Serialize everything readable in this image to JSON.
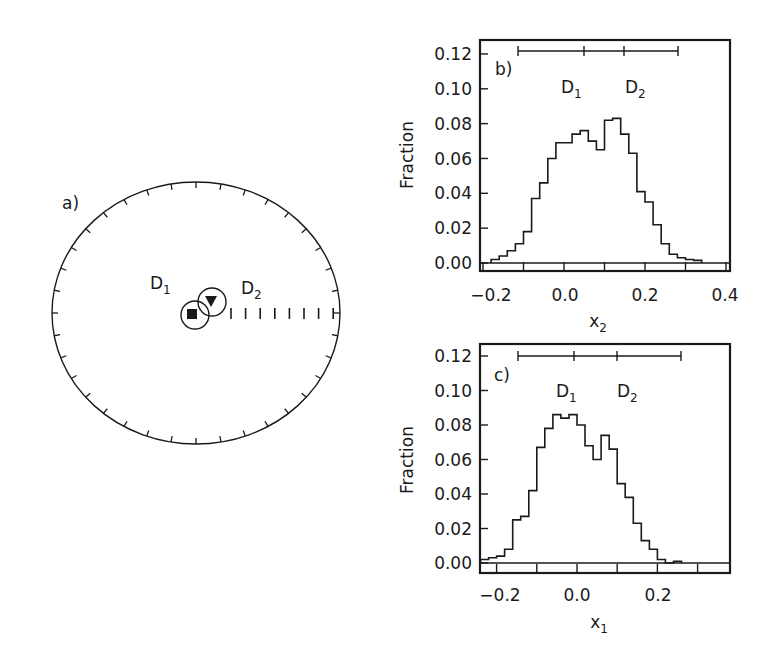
{
  "chart_data": [
    {
      "panel": "a",
      "type": "scatter",
      "title": "",
      "panel_label": "a)",
      "description": "Polar/circular plot with 36 perimeter ticks (every 10 degrees) and a horizontal radial scale of tick marks; two markers with confidence circles near the center",
      "markers": [
        {
          "name": "D1",
          "label": "D",
          "subscript": "1",
          "symbol": "filled-square",
          "x": 192,
          "y": 314
        },
        {
          "name": "D2",
          "label": "D",
          "subscript": "2",
          "symbol": "filled-down-triangle",
          "x": 211,
          "y": 300
        }
      ],
      "perimeter_ticks": 36,
      "radial_scale_ticks": 8
    },
    {
      "panel": "b",
      "type": "bar",
      "style": "step-histogram",
      "panel_label": "b)",
      "title": "",
      "xlabel": "x",
      "xlabel_sub": "2",
      "ylabel": "Fraction",
      "xlim": [
        -0.2,
        0.4
      ],
      "ylim": [
        0.0,
        0.12
      ],
      "xticks": [
        "-0.2",
        "0.0",
        "0.2",
        "0.4"
      ],
      "yticks": [
        "0.00",
        "0.02",
        "0.04",
        "0.06",
        "0.08",
        "0.10",
        "0.12"
      ],
      "bin_width": 0.02,
      "bin_start": -0.18,
      "values": [
        0.002,
        0.004,
        0.007,
        0.011,
        0.018,
        0.037,
        0.046,
        0.06,
        0.069,
        0.069,
        0.074,
        0.076,
        0.07,
        0.065,
        0.082,
        0.083,
        0.074,
        0.063,
        0.041,
        0.035,
        0.022,
        0.011,
        0.005,
        0.003,
        0.002,
        0.0015
      ],
      "error_bar": {
        "min": -0.13,
        "D1": 0.035,
        "D2": 0.135,
        "max": 0.28
      },
      "annotations": [
        {
          "text": "D",
          "sub": "1"
        },
        {
          "text": "D",
          "sub": "2"
        }
      ]
    },
    {
      "panel": "c",
      "type": "bar",
      "style": "step-histogram",
      "panel_label": "c)",
      "title": "",
      "xlabel": "x",
      "xlabel_sub": "1",
      "ylabel": "Fraction",
      "xlim": [
        -0.25,
        0.35
      ],
      "ylim": [
        0.0,
        0.12
      ],
      "xticks": [
        "-0.2",
        "0.0",
        "0.2"
      ],
      "yticks": [
        "0.00",
        "0.02",
        "0.04",
        "0.06",
        "0.08",
        "0.10",
        "0.12"
      ],
      "bin_width": 0.02,
      "bin_start": -0.24,
      "values": [
        0.002,
        0.003,
        0.004,
        0.008,
        0.025,
        0.027,
        0.042,
        0.067,
        0.078,
        0.086,
        0.084,
        0.086,
        0.08,
        0.068,
        0.06,
        0.074,
        0.066,
        0.046,
        0.038,
        0.023,
        0.013,
        0.008,
        0.002,
        0.0,
        0.001
      ],
      "error_bar": {
        "min": -0.155,
        "D1": -0.015,
        "D2": 0.09,
        "max": 0.25
      },
      "annotations": [
        {
          "text": "D",
          "sub": "1"
        },
        {
          "text": "D",
          "sub": "2"
        }
      ]
    }
  ],
  "panel_a": {
    "label": "a)",
    "d1_label": "D",
    "d1_sub": "1",
    "d2_label": "D",
    "d2_sub": "2"
  },
  "panel_b": {
    "label": "b)",
    "ylabel": "Fraction",
    "xlabel": "x",
    "xlabel_sub": "2",
    "d1_label": "D",
    "d1_sub": "1",
    "d2_label": "D",
    "d2_sub": "2",
    "xtick_labels": [
      "−0.2",
      "0.0",
      "0.2",
      "0.4"
    ],
    "ytick_labels": [
      "0.00",
      "0.02",
      "0.04",
      "0.06",
      "0.08",
      "0.10",
      "0.12"
    ]
  },
  "panel_c": {
    "label": "c)",
    "ylabel": "Fraction",
    "xlabel": "x",
    "xlabel_sub": "1",
    "d1_label": "D",
    "d1_sub": "1",
    "d2_label": "D",
    "d2_sub": "2",
    "xtick_labels": [
      "−0.2",
      "0.0",
      "0.2"
    ],
    "ytick_labels": [
      "0.00",
      "0.02",
      "0.04",
      "0.06",
      "0.08",
      "0.10",
      "0.12"
    ]
  }
}
